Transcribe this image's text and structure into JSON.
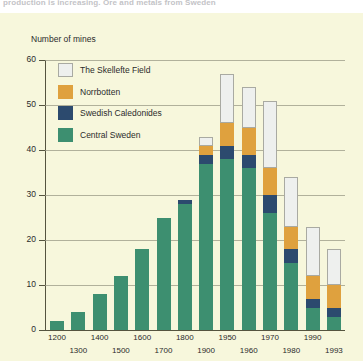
{
  "caption": {
    "text": "production is increasing. Ore and metals from Sweden"
  },
  "axis": {
    "y_title": "Number of mines",
    "y_ticks": [
      0,
      10,
      20,
      30,
      40,
      50,
      60
    ]
  },
  "legend": {
    "items": [
      {
        "label": "The Skellefte Field",
        "color": "#eef0ee",
        "key": "skellefte"
      },
      {
        "label": "Norrbotten",
        "color": "#dfa13e",
        "key": "norrbotten"
      },
      {
        "label": "Swedish Caledonides",
        "color": "#2c4a6e",
        "key": "caledonides"
      },
      {
        "label": "Central Sweden",
        "color": "#3d8f70",
        "key": "central"
      }
    ]
  },
  "chart_data": {
    "type": "bar",
    "title": "Number of mines",
    "xlabel": "",
    "ylabel": "Number of mines",
    "ylim": [
      0,
      60
    ],
    "grid": true,
    "stacked": true,
    "legend_position": "inside-top-left",
    "categories": [
      "1200",
      "1300",
      "1400",
      "1500",
      "1600",
      "1700",
      "1800",
      "1900",
      "1950",
      "1960",
      "1970",
      "1980",
      "1990",
      "1993"
    ],
    "series": [
      {
        "name": "Central Sweden",
        "color": "#3d8f70",
        "values": [
          2,
          4,
          8,
          12,
          18,
          25,
          28,
          37,
          38,
          36,
          26,
          15,
          5,
          3
        ]
      },
      {
        "name": "Swedish Caledonides",
        "color": "#2c4a6e",
        "values": [
          0,
          0,
          0,
          0,
          0,
          0,
          1,
          2,
          3,
          3,
          4,
          3,
          2,
          2
        ]
      },
      {
        "name": "Norrbotten",
        "color": "#dfa13e",
        "values": [
          0,
          0,
          0,
          0,
          0,
          0,
          0,
          2,
          5,
          6,
          6,
          5,
          5,
          5
        ]
      },
      {
        "name": "The Skellefte Field",
        "color": "#eef0ee",
        "values": [
          0,
          0,
          0,
          0,
          0,
          0,
          0,
          2,
          11,
          9,
          15,
          11,
          11,
          8
        ]
      }
    ],
    "totals": [
      2,
      4,
      8,
      12,
      18,
      25,
      29,
      43,
      57,
      54,
      51,
      34,
      23,
      18
    ]
  }
}
